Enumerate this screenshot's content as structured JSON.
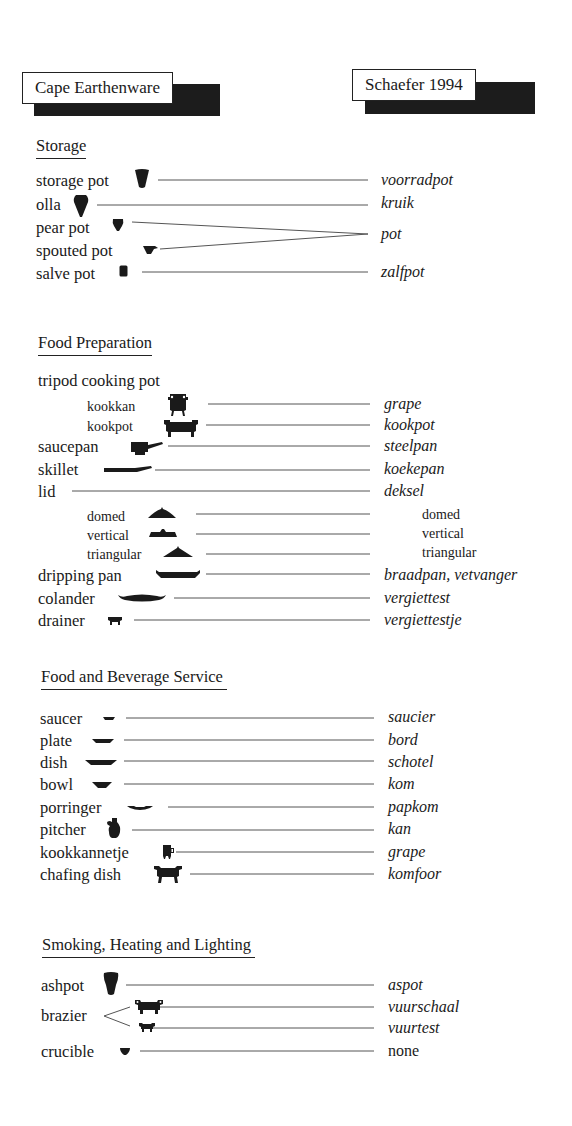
{
  "header": {
    "left_title": "Cape Earthenware",
    "right_title": "Schaefer 1994"
  },
  "sections": [
    {
      "heading": "Storage",
      "items": [
        {
          "term": "storage pot",
          "icon": "storage-pot-icon",
          "dutch": "voorradpot"
        },
        {
          "term": "olla",
          "icon": "olla-icon",
          "dutch": "kruik"
        },
        {
          "term": "pear pot",
          "icon": "pear-pot-icon",
          "dutch": "pot"
        },
        {
          "term": "spouted pot",
          "icon": "spouted-pot-icon",
          "dutch": "pot"
        },
        {
          "term": "salve pot",
          "icon": "salve-pot-icon",
          "dutch": "zalfpot"
        }
      ]
    },
    {
      "heading": "Food Preparation",
      "items": [
        {
          "term": "tripod cooking pot",
          "icon": null,
          "dutch": null
        },
        {
          "term": "kookkan",
          "icon": "kookkan-icon",
          "dutch": "grape"
        },
        {
          "term": "kookpot",
          "icon": "kookpot-icon",
          "dutch": "kookpot"
        },
        {
          "term": "saucepan",
          "icon": "saucepan-icon",
          "dutch": "steelpan"
        },
        {
          "term": "skillet",
          "icon": "skillet-icon",
          "dutch": "koekepan"
        },
        {
          "term": "lid",
          "icon": null,
          "dutch": "deksel"
        },
        {
          "term": "domed",
          "icon": "domed-lid-icon",
          "dutch": "domed"
        },
        {
          "term": "vertical",
          "icon": "vertical-lid-icon",
          "dutch": "vertical"
        },
        {
          "term": "triangular",
          "icon": "triangular-lid-icon",
          "dutch": "triangular"
        },
        {
          "term": "dripping pan",
          "icon": "dripping-pan-icon",
          "dutch": "braadpan, vetvanger"
        },
        {
          "term": "colander",
          "icon": "colander-icon",
          "dutch": "vergiettest"
        },
        {
          "term": "drainer",
          "icon": "drainer-icon",
          "dutch": "vergiettestje"
        }
      ]
    },
    {
      "heading": "Food and Beverage Service",
      "items": [
        {
          "term": "saucer",
          "icon": "saucer-icon",
          "dutch": "saucier"
        },
        {
          "term": "plate",
          "icon": "plate-icon",
          "dutch": "bord"
        },
        {
          "term": "dish",
          "icon": "dish-icon",
          "dutch": "schotel"
        },
        {
          "term": "bowl",
          "icon": "bowl-icon",
          "dutch": "kom"
        },
        {
          "term": "porringer",
          "icon": "porringer-icon",
          "dutch": "papkom"
        },
        {
          "term": "pitcher",
          "icon": "pitcher-icon",
          "dutch": "kan"
        },
        {
          "term": "kookkannetje",
          "icon": "kookkannetje-icon",
          "dutch": "grape"
        },
        {
          "term": "chafing dish",
          "icon": "chafing-dish-icon",
          "dutch": "komfoor"
        }
      ]
    },
    {
      "heading": "Smoking, Heating and Lighting",
      "items": [
        {
          "term": "ashpot",
          "icon": "ashpot-icon",
          "dutch": "aspot"
        },
        {
          "term": "brazier",
          "icon": "brazier-large-icon",
          "dutch": "vuurschaal"
        },
        {
          "term": "brazier",
          "icon": "brazier-small-icon",
          "dutch": "vuurtest"
        },
        {
          "term": "crucible",
          "icon": "crucible-icon",
          "dutch": "none"
        }
      ]
    }
  ],
  "colors": {
    "ink": "#1a1a1a",
    "shadow": "#1c1c1c",
    "line": "#555555",
    "background": "#ffffff"
  }
}
